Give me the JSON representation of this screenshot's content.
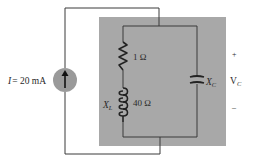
{
  "diagram": {
    "type": "circuit",
    "background_box_color": "#a8a8a8",
    "wire_color": "#3a3a3a",
    "source": {
      "label": "I = 20 mA",
      "label_I": "I",
      "label_value": "= 20 mA",
      "kind": "current-source",
      "direction": "up",
      "fill": "#9a9a9a"
    },
    "resistor": {
      "label": "1 Ω"
    },
    "inductor": {
      "symbol": "X",
      "subscript": "L",
      "value": "40 Ω"
    },
    "capacitor": {
      "symbol": "X",
      "subscript": "C"
    },
    "voltage": {
      "plus": "+",
      "symbol": "V",
      "subscript": "C",
      "minus": "–"
    }
  }
}
